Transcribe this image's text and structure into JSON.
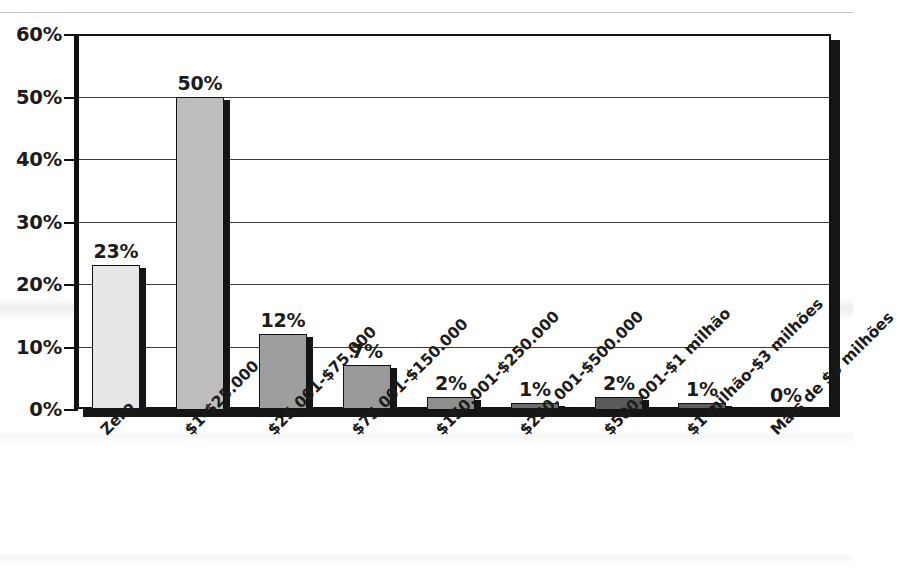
{
  "chart_data": {
    "type": "bar",
    "title": "",
    "subtitle": "",
    "xlabel": "",
    "ylabel": "",
    "ylim": [
      0,
      60
    ],
    "y_tick_labels": [
      "0%",
      "10%",
      "20%",
      "30%",
      "40%",
      "50%",
      "60%"
    ],
    "y_tick_values": [
      0,
      10,
      20,
      30,
      40,
      50,
      60
    ],
    "grid": true,
    "legend": "none",
    "value_suffix": "%",
    "categories": [
      "Zero",
      "$1-$25.000",
      "$25.001-$75.000",
      "$75.001-$150.000",
      "$150.001-$250.000",
      "$250.001-$500.000",
      "$500.001-$1 milhão",
      "$1 milhão-$3 milhões",
      "Mais de $3 milhões"
    ],
    "values": [
      23,
      50,
      12,
      7,
      2,
      1,
      2,
      1,
      0
    ],
    "data_labels": [
      "23%",
      "50%",
      "12%",
      "7%",
      "2%",
      "1%",
      "2%",
      "1%",
      "0%"
    ],
    "bar_fills": [
      "#e6e6e6",
      "#bdbdbd",
      "#9e9e9e",
      "#999999",
      "#8f8f8f",
      "#6e6e6e",
      "#5a5a5a",
      "#5e5e5e",
      "#ffffff"
    ],
    "colors": {
      "axis": "#111111",
      "grid": "#3a3a3a",
      "text": "#1b1b1b",
      "shadow": "#161616",
      "background": "#ffffff"
    }
  }
}
